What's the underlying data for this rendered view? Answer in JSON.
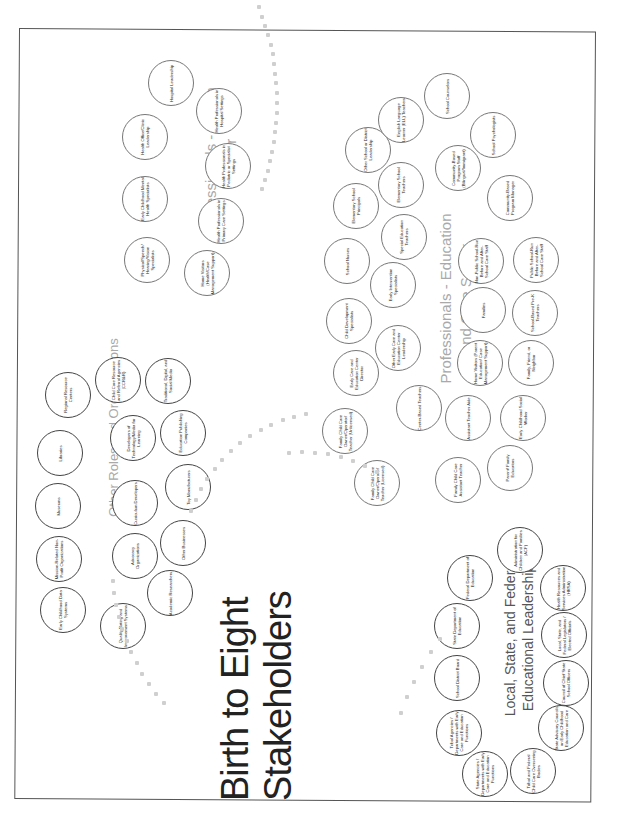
{
  "poster": {
    "title_line1": "Birth to Eight",
    "title_line2": "Stakeholders",
    "caption": "Gopal, S. & Clarke, T. (2015) System mapping: A guide to developing assessment... Seattle, WA: SSC ...",
    "orientation": "rotated 90° counterclockwise"
  },
  "clusters": {
    "leadership": {
      "title_line1": "Local, State, and Federal",
      "title_line2": "Educational Leadership",
      "items": [
        "State Agencies / Departments with Early Care and Education Functions",
        "Tribal Agencies / Departments with Early Care and Education Functions",
        "School District Board",
        "State Department of Education",
        "Federal Department of Education",
        "Tribal and Federal Child Care Overseeing Bodies",
        "State Advisory Councils on Early Childhood Education and Care",
        "Council of Chief State School Officers",
        "Local, State, and Federal Legislators / Elected Officials",
        "Health Resources and Services Administration (HRSA)",
        "Administration for Children and Families (ACF)"
      ]
    },
    "other_roles": {
      "title": "Other Roles and Organizations",
      "items": [
        "Early Childhood Data Systems",
        "Mission-Related Non-Profit Organizations",
        "Museums",
        "Libraries",
        "Regional Resource Centers",
        "Quality Rating and Improvement Systems",
        "Advocacy Organizations",
        "Curriculum Developers",
        "Developers of Technology/Media for Learning",
        "Child Care Resource and Referral Agencies (CCR&R)",
        "Academic Researchers",
        "Other Businesses",
        "Toy Manufacturers",
        "Education Publishing Companies",
        "Traditional, Digital, and Social Media"
      ]
    },
    "health": {
      "title_line1": "Professionals - Health",
      "title_line2": "Sector",
      "items": [
        "Physical/Speech/ Hearing/Vision Specialists",
        "Early Childhood Mental Health Specialists",
        "Health Office/Clinic Leadership",
        "Hospital Leadership",
        "Home Visitors (Health/Case Management Support)",
        "Health Professionals in Primary Care Settings",
        "Health Professionals in Pediatric or Specialist Settings",
        "Health Professionals in Hospital Settings"
      ]
    },
    "education": {
      "title_line1": "Professionals - Education",
      "title_line2": "and Care Sector",
      "items": [
        "Family Child Care Owner/Operator/ Teacher (Licensed)",
        "Family Child Care Owner/Operator/ Teacher (Unlicensed)",
        "Early Care and Education Center Director",
        "Child Development Specialists",
        "School Nurses",
        "Elementary School Principals",
        "Other School or District Leadership",
        "English Language Learner (ELL) Teachers",
        "School Counselors",
        "Center-Based Teachers",
        "Other Early Care and Education Center Leadership",
        "Early Intervention Specialists",
        "Special Education Teachers",
        "Elementary School Teachers",
        "Community-Based Program Staff (Bilingual/Immigrant)",
        "School Psychologists",
        "Family Child Care Assistant Teacher",
        "Assistant Teacher Aide",
        "Home Visitors (Parent Education/ Case Management Support)",
        "Families",
        "Non-Public School-Run Before and After-School Care Staff",
        "Community-Based Program Manager",
        "Parent/ Family Educators",
        "Early Childhood Social Worker",
        "Family, Friend, or Neighbor",
        "School-Based Pre-K Teachers",
        "Public School-Run Before and After-School Care Staff"
      ]
    }
  }
}
